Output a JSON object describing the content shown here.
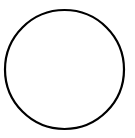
{
  "canvas": {
    "width": 135,
    "height": 138,
    "background": "#ffffff"
  },
  "shape": {
    "type": "circle",
    "cx": 64.5,
    "cy": 69.5,
    "r": 59.5,
    "stroke": "#000000",
    "stroke_width": 2.2,
    "fill": "none"
  }
}
